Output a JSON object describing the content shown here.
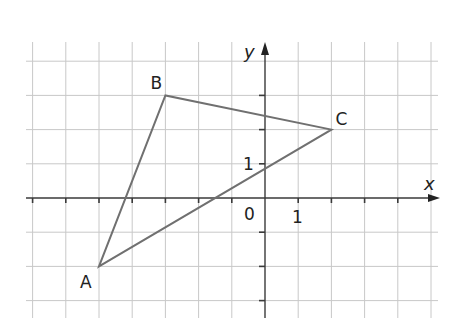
{
  "diagram": {
    "type": "coordinate-plane-triangle",
    "axes": {
      "x_label": "x",
      "y_label": "y",
      "origin_label": "0",
      "x_unit_label": "1",
      "y_unit_label": "1",
      "x_range": [
        -7,
        5
      ],
      "y_range": [
        -3,
        4
      ]
    },
    "grid": {
      "color": "#c8c8c8",
      "spacing_units": 1
    },
    "triangle": {
      "stroke_color": "#707070",
      "vertices": [
        {
          "name": "A",
          "x": -5,
          "y": -2
        },
        {
          "name": "B",
          "x": -3,
          "y": 3
        },
        {
          "name": "C",
          "x": 2,
          "y": 2
        }
      ]
    },
    "labels": {
      "A": "A",
      "B": "B",
      "C": "C"
    }
  }
}
